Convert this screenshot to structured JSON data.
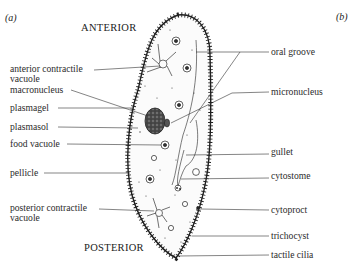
{
  "panels": {
    "a": "(a)",
    "b": "(b)"
  },
  "orientation": {
    "top": "ANTERIOR",
    "bottom": "POSTERIOR"
  },
  "labels_left": [
    {
      "id": "anterior-contractile-vacuole",
      "line1": "anterior contractile",
      "line2": "vacuole"
    },
    {
      "id": "macronucleus",
      "line1": "macronucleus"
    },
    {
      "id": "plasmagel",
      "line1": "plasmagel"
    },
    {
      "id": "plasmasol",
      "line1": "plasmasol"
    },
    {
      "id": "food-vacuole",
      "line1": "food vacuole"
    },
    {
      "id": "pellicle",
      "line1": "pellicle"
    },
    {
      "id": "posterior-contractile-vacuole",
      "line1": "posterior contractile",
      "line2": "vacuole"
    }
  ],
  "labels_right": [
    {
      "id": "oral-groove",
      "line1": "oral groove"
    },
    {
      "id": "micronucleus",
      "line1": "micronucleus"
    },
    {
      "id": "gullet",
      "line1": "gullet"
    },
    {
      "id": "cytostome",
      "line1": "cytostome"
    },
    {
      "id": "cytoproct",
      "line1": "cytoproct"
    },
    {
      "id": "trichocyst",
      "line1": "trichocyst"
    },
    {
      "id": "tactile-cilia",
      "line1": "tactile cilia"
    }
  ],
  "colors": {
    "ink": "#2a2a2a",
    "nucleus_fill": "#555555",
    "background": "#ffffff"
  }
}
